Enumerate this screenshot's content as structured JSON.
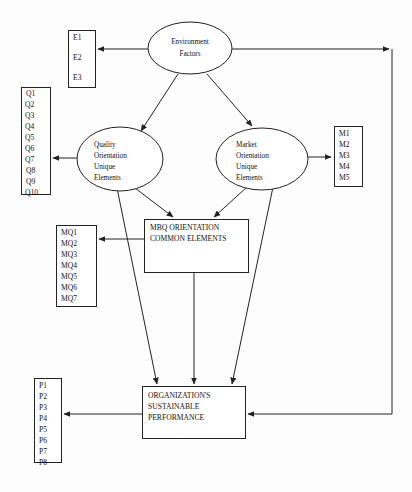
{
  "diagram": {
    "background_color": "#fdfdfd",
    "line_color": "#222222",
    "node_fill": "#ffffff",
    "nodes": {
      "environment_factors": {
        "label_line1": "Environment",
        "label_line2": "Factors",
        "shape": "ellipse"
      },
      "quality_orientation": {
        "label_line1": "Quality",
        "label_line2": "Orientation",
        "label_line3": "Unique",
        "label_line4": "Elements",
        "shape": "ellipse"
      },
      "market_orientation": {
        "label_line1": "Market",
        "label_line2": "Orientation",
        "label_line3": "Unique",
        "label_line4": "Elements",
        "shape": "ellipse"
      },
      "mbq_common": {
        "label_line1": "MBQ ORIENTATION",
        "label_line2": "COMMON ELEMENTS",
        "shape": "rectangle"
      },
      "sustainable_performance": {
        "label_line1": "ORGANIZATION'S",
        "label_line2": "SUSTAINABLE",
        "label_line3": "PERFORMANCE",
        "shape": "rectangle"
      }
    },
    "indicator_lists": {
      "environment": {
        "name": "E",
        "items": [
          "E1",
          "E2",
          "E3"
        ]
      },
      "quality": {
        "name": "Q",
        "items": [
          "Q1",
          "Q2",
          "Q3",
          "Q4",
          "Q5",
          "Q6",
          "Q7",
          "Q8",
          "Q9",
          "Q10"
        ]
      },
      "market": {
        "name": "M",
        "items": [
          "M1",
          "M2",
          "M3",
          "M4",
          "M5"
        ]
      },
      "mbq": {
        "name": "MQ",
        "items": [
          "MQ1",
          "MQ2",
          "MQ3",
          "MQ4",
          "MQ5",
          "MQ6",
          "MQ7"
        ]
      },
      "performance": {
        "name": "P",
        "items": [
          "P1",
          "P2",
          "P3",
          "P4",
          "P5",
          "P6",
          "P7",
          "P8"
        ]
      }
    },
    "connections": [
      {
        "from": "environment_factors",
        "to": "e-list",
        "style": "arrow"
      },
      {
        "from": "environment_factors",
        "to": "feedback-right",
        "style": "arrow"
      },
      {
        "from": "environment_factors",
        "to": "quality_orientation",
        "style": "arrow"
      },
      {
        "from": "environment_factors",
        "to": "market_orientation",
        "style": "arrow"
      },
      {
        "from": "quality_orientation",
        "to": "q-list",
        "style": "arrow"
      },
      {
        "from": "market_orientation",
        "to": "m-list",
        "style": "arrow"
      },
      {
        "from": "quality_orientation",
        "to": "mbq_common",
        "style": "arrow"
      },
      {
        "from": "market_orientation",
        "to": "mbq_common",
        "style": "arrow"
      },
      {
        "from": "quality_orientation",
        "to": "sustainable_performance",
        "style": "arrow"
      },
      {
        "from": "market_orientation",
        "to": "sustainable_performance",
        "style": "arrow"
      },
      {
        "from": "mbq_common",
        "to": "mq-list",
        "style": "arrow"
      },
      {
        "from": "mbq_common",
        "to": "sustainable_performance",
        "style": "arrow"
      },
      {
        "from": "feedback-right",
        "to": "sustainable_performance",
        "style": "arrow"
      },
      {
        "from": "sustainable_performance",
        "to": "p-list",
        "style": "arrow"
      }
    ]
  }
}
